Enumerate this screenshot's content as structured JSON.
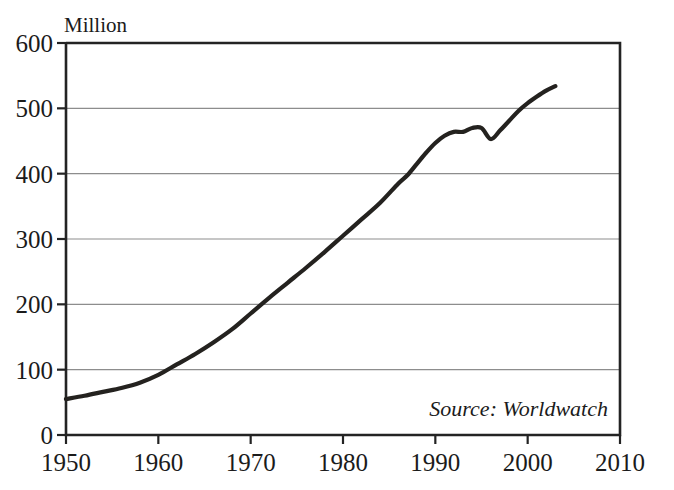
{
  "chart_data": {
    "type": "line",
    "title": "",
    "ylabel": "Million",
    "xlabel": "",
    "xlim": [
      1950,
      2010
    ],
    "ylim": [
      0,
      600
    ],
    "grid": true,
    "legend_position": "none",
    "annotation": "Source: Worldwatch",
    "yticks": [
      0,
      100,
      200,
      300,
      400,
      500,
      600
    ],
    "ytick_labels": [
      "0",
      "100",
      "200",
      "300",
      "400",
      "500",
      "600"
    ],
    "xticks": [
      1950,
      1960,
      1970,
      1980,
      1990,
      2000,
      2010
    ],
    "xtick_labels": [
      "1950",
      "1960",
      "1970",
      "1980",
      "1990",
      "2000",
      "2010"
    ],
    "series": [
      {
        "name": "Million",
        "color": "#24221f",
        "x": [
          1950,
          1952,
          1954,
          1956,
          1958,
          1960,
          1962,
          1964,
          1966,
          1968,
          1970,
          1972,
          1974,
          1976,
          1978,
          1980,
          1982,
          1984,
          1986,
          1987,
          1988,
          1989,
          1990,
          1991,
          1992,
          1993,
          1994,
          1995,
          1996,
          1997,
          1998,
          1999,
          2000,
          2001,
          2002,
          2003
        ],
        "y": [
          55,
          60,
          66,
          72,
          80,
          92,
          108,
          124,
          142,
          162,
          186,
          210,
          233,
          256,
          280,
          305,
          330,
          355,
          385,
          398,
          415,
          432,
          447,
          458,
          464,
          464,
          470,
          470,
          453,
          466,
          481,
          496,
          508,
          518,
          527,
          534
        ]
      }
    ]
  },
  "axis_labels": {
    "y_title": "Million"
  },
  "source": {
    "text": "Source: Worldwatch"
  }
}
